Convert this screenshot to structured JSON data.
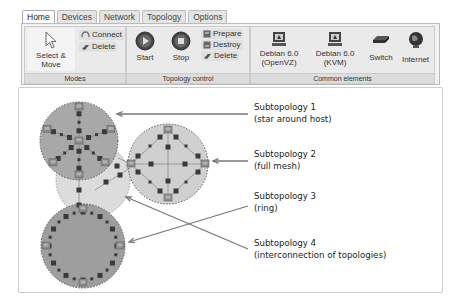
{
  "tabs": [
    {
      "label": "Home",
      "active": true
    },
    {
      "label": "Devices",
      "active": false
    },
    {
      "label": "Network",
      "active": false
    },
    {
      "label": "Topology",
      "active": false
    },
    {
      "label": "Options",
      "active": false
    }
  ],
  "ribbon": {
    "modes": {
      "label": "Modes",
      "select_move": "Select & Move",
      "connect": "Connect",
      "delete": "Delete"
    },
    "topology_control": {
      "label": "Topology control",
      "start": "Start",
      "stop": "Stop",
      "prepare": "Prepare",
      "destroy": "Destroy",
      "delete": "Delete"
    },
    "common_elements": {
      "label": "Common elements",
      "debian_openvz_line1": "Debian 6.0",
      "debian_openvz_line2": "(OpenVZ)",
      "debian_kvm_line1": "Debian 6.0",
      "debian_kvm_line2": "(KVM)",
      "switch": "Switch",
      "internet": "Internet"
    }
  },
  "annotations": [
    {
      "title": "Subtopology 1",
      "desc": "(star around host)"
    },
    {
      "title": "Subtopology 2",
      "desc": "(full mesh)"
    },
    {
      "title": "Subtopology 3",
      "desc": "(ring)"
    },
    {
      "title": "Subtopology 4",
      "desc": "(interconnection of topologies)"
    }
  ],
  "colors": {
    "star_fill": "#a8a8a8",
    "mesh_fill": "#d0d0d0",
    "ring_fill": "#9e9e9e",
    "interconnect_fill": "#dcdcdc",
    "node": "#3a3a3a",
    "arrow": "#777777"
  }
}
